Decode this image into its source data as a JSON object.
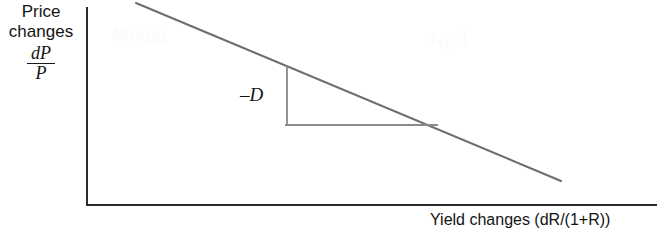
{
  "figure": {
    "width": 666,
    "height": 230,
    "background": "#ffffff",
    "axis_color": "#2b2b2b",
    "curve_color": "#6e6e6e",
    "triangle_color": "#8a8a8a",
    "text_color": "#141414"
  },
  "axes": {
    "y_label_line1": "Price",
    "y_label_line2": "changes",
    "y_label_fraction_numerator": "dP",
    "y_label_fraction_denominator": "P",
    "x_label": "Yield changes (dR/(1+R))",
    "y_axis_x": 87,
    "y_axis_top": 8,
    "y_axis_bottom": 205,
    "x_axis_y": 205,
    "x_axis_left": 87,
    "x_axis_right": 656
  },
  "annotations": {
    "slope_label": "–D"
  },
  "watermarks": {
    "left": "Media",
    "right": "Nprl"
  },
  "chart_data": {
    "type": "line",
    "title": "",
    "xlabel": "Yield changes (dR/(1+R))",
    "ylabel": "Price changes dP/P",
    "grid": false,
    "legend": null,
    "xlim": [
      87,
      656
    ],
    "ylim": [
      205,
      8
    ],
    "series": [
      {
        "name": "Duration line (slope = -D)",
        "kind": "straight-line",
        "points": [
          {
            "x": 136,
            "y": 3
          },
          {
            "x": 561,
            "y": 181
          }
        ],
        "color": "#6e6e6e",
        "width": 2.1
      }
    ],
    "annotations": [
      {
        "name": "slope-triangle",
        "kind": "right-triangle",
        "label": "–D",
        "label_position": {
          "x": 240,
          "y": 84
        },
        "vertices": [
          {
            "x": 287,
            "y": 66
          },
          {
            "x": 287,
            "y": 125
          },
          {
            "x": 437,
            "y": 125
          }
        ],
        "rise_leg": {
          "x1": 287,
          "y1": 66,
          "x2": 287,
          "y2": 125
        },
        "run_leg": {
          "x1": 287,
          "y1": 125,
          "x2": 437,
          "y2": 125
        },
        "color": "#8a8a8a",
        "width": 1.8
      }
    ]
  }
}
